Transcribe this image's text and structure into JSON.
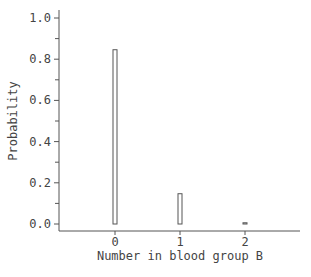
{
  "chart_data": {
    "type": "bar",
    "title": "",
    "xlabel": "Number in blood group B",
    "ylabel": "Probability",
    "categories": [
      "0",
      "1",
      "2"
    ],
    "x": [
      0,
      1,
      2
    ],
    "values": [
      0.846,
      0.147,
      0.006
    ],
    "ylim": [
      0.0,
      1.0
    ],
    "xlim": [
      -0.9,
      2.8
    ],
    "yticks": [
      0.0,
      0.2,
      0.4,
      0.6,
      0.8,
      1.0
    ],
    "ytick_labels": [
      "0.0",
      "0.2",
      "0.4",
      "0.6",
      "0.8",
      "1.0"
    ],
    "xticks": [
      0,
      1,
      2
    ],
    "xtick_labels": [
      "0",
      "1",
      "2"
    ],
    "grid": false,
    "legend": null
  }
}
